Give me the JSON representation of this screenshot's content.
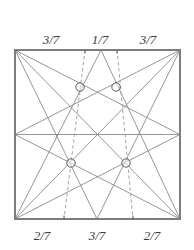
{
  "figure": {
    "type": "geometry-diagram",
    "colors": {
      "background": "#ffffff",
      "square_border": "#7d7d7d",
      "solid_line": "#8a8a8a",
      "dashed_line": "#9a9a9a",
      "marker_stroke": "#5a5a5a",
      "label_text": "#3a3a3a"
    },
    "square": {
      "left": 15,
      "top": 50,
      "right": 180,
      "bottom": 219,
      "stroke_width": 2.0
    },
    "top_labels": [
      {
        "text": "3/7",
        "x": 51,
        "y": 44
      },
      {
        "text": "1/7",
        "x": 100,
        "y": 44
      },
      {
        "text": "3/7",
        "x": 148,
        "y": 44
      }
    ],
    "bottom_labels": [
      {
        "text": "2/7",
        "x": 42,
        "y": 240
      },
      {
        "text": "3/7",
        "x": 97,
        "y": 240
      },
      {
        "text": "2/7",
        "x": 152,
        "y": 240
      }
    ],
    "vertices": {
      "top_left": {
        "x": 15,
        "y": 50
      },
      "top_right": {
        "x": 180,
        "y": 50
      },
      "bottom_left": {
        "x": 15,
        "y": 219
      },
      "bottom_right": {
        "x": 180,
        "y": 219
      },
      "left_mid": {
        "x": 15,
        "y": 134.5
      },
      "right_mid": {
        "x": 180,
        "y": 134.5
      },
      "top_apex": {
        "x": 101,
        "y": 50
      },
      "bottom_apex": {
        "x": 97,
        "y": 219
      }
    },
    "solid_segments": [
      {
        "name": "diagonal-tl-br",
        "x1": 15,
        "y1": 50,
        "x2": 180,
        "y2": 219
      },
      {
        "name": "diagonal-tr-bl",
        "x1": 180,
        "y1": 50,
        "x2": 15,
        "y2": 219
      },
      {
        "name": "tl-to-rightmid",
        "x1": 15,
        "y1": 50,
        "x2": 180,
        "y2": 134.5
      },
      {
        "name": "tr-to-leftmid",
        "x1": 180,
        "y1": 50,
        "x2": 15,
        "y2": 134.5
      },
      {
        "name": "bl-to-rightmid",
        "x1": 15,
        "y1": 219,
        "x2": 180,
        "y2": 134.5
      },
      {
        "name": "br-to-leftmid",
        "x1": 180,
        "y1": 219,
        "x2": 15,
        "y2": 134.5
      },
      {
        "name": "leftmid-to-rightmid",
        "x1": 15,
        "y1": 134.5,
        "x2": 180,
        "y2": 134.5
      },
      {
        "name": "topapex-to-bl",
        "x1": 101,
        "y1": 50,
        "x2": 15,
        "y2": 219
      },
      {
        "name": "topapex-to-br",
        "x1": 101,
        "y1": 50,
        "x2": 180,
        "y2": 219
      },
      {
        "name": "botapex-to-tl",
        "x1": 97,
        "y1": 219,
        "x2": 15,
        "y2": 50
      },
      {
        "name": "botapex-to-tr",
        "x1": 97,
        "y1": 219,
        "x2": 180,
        "y2": 50
      }
    ],
    "dashed_segments": [
      {
        "name": "dashed-left",
        "x1": 85,
        "y1": 50,
        "x2": 64,
        "y2": 219
      },
      {
        "name": "dashed-right",
        "x1": 117,
        "y1": 50,
        "x2": 133,
        "y2": 219
      }
    ],
    "tick_marks": [
      {
        "name": "top-tick-left",
        "x": 85,
        "y": 50,
        "edge": "top"
      },
      {
        "name": "top-tick-right",
        "x": 117,
        "y": 50,
        "edge": "top"
      },
      {
        "name": "bottom-tick-left",
        "x": 64,
        "y": 219,
        "edge": "bottom"
      },
      {
        "name": "bottom-tick-right",
        "x": 133,
        "y": 219,
        "edge": "bottom"
      }
    ],
    "intersection_markers": [
      {
        "name": "marker-upper-left",
        "x": 80,
        "y": 87,
        "r": 4.2
      },
      {
        "name": "marker-upper-right",
        "x": 116,
        "y": 87,
        "r": 4.2
      },
      {
        "name": "marker-lower-left",
        "x": 71,
        "y": 163,
        "r": 4.2
      },
      {
        "name": "marker-lower-right",
        "x": 126,
        "y": 163,
        "r": 4.2
      }
    ]
  }
}
